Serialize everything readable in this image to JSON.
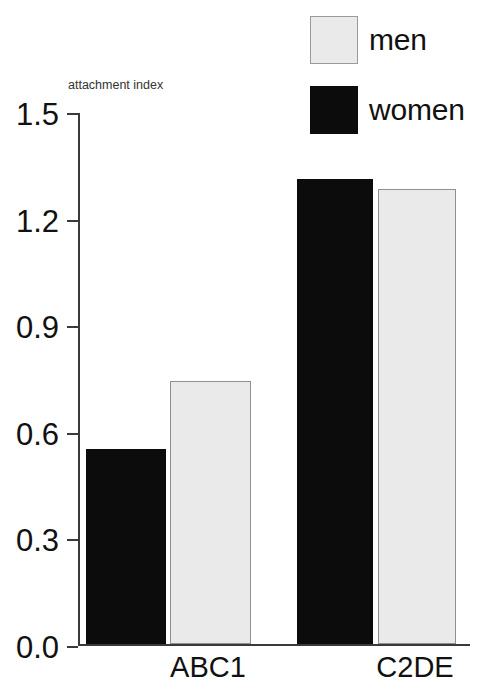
{
  "chart_data": {
    "type": "bar",
    "title": "",
    "subtitle": "",
    "xlabel": "",
    "ylabel": "attachment index",
    "categories": [
      "ABC1",
      "C2DE"
    ],
    "series": [
      {
        "name": "men",
        "color": "#eaeaea",
        "values": [
          0.74,
          1.28
        ]
      },
      {
        "name": "women",
        "color": "#0c0c0c",
        "values": [
          0.55,
          1.31
        ]
      }
    ],
    "series_order_in_plot": [
      "women",
      "men"
    ],
    "ylim": [
      0.0,
      1.5
    ],
    "yticks": [
      0.0,
      0.3,
      0.6,
      0.9,
      1.2,
      1.5
    ],
    "ytick_labels": [
      "0.0",
      "0.3",
      "0.6",
      "0.9",
      "1.2",
      "1.5"
    ],
    "grid": false,
    "legend_position": "top-right",
    "legend_entries": [
      "men",
      "women"
    ]
  },
  "axis": {
    "title": "attachment index",
    "ticks": [
      {
        "label": "1.5",
        "value": 1.5
      },
      {
        "label": "1.2",
        "value": 1.2
      },
      {
        "label": "0.9",
        "value": 0.9
      },
      {
        "label": "0.6",
        "value": 0.6
      },
      {
        "label": "0.3",
        "value": 0.3
      },
      {
        "label": "0.0",
        "value": 0.0
      }
    ]
  },
  "legend": {
    "items": [
      {
        "label": "men",
        "swatch": "men"
      },
      {
        "label": "women",
        "swatch": "women"
      }
    ]
  },
  "categories": [
    {
      "label": "ABC1"
    },
    {
      "label": "C2DE"
    }
  ],
  "bars": [
    {
      "group": "ABC1",
      "series": "women",
      "value": 0.55,
      "left_px": 8,
      "width_px": 80
    },
    {
      "group": "ABC1",
      "series": "men",
      "value": 0.74,
      "left_px": 92,
      "width_px": 81
    },
    {
      "group": "C2DE",
      "series": "women",
      "value": 1.31,
      "left_px": 219,
      "width_px": 76
    },
    {
      "group": "C2DE",
      "series": "men",
      "value": 1.28,
      "left_px": 300,
      "width_px": 78
    }
  ],
  "category_positions_px": [
    130,
    337
  ]
}
